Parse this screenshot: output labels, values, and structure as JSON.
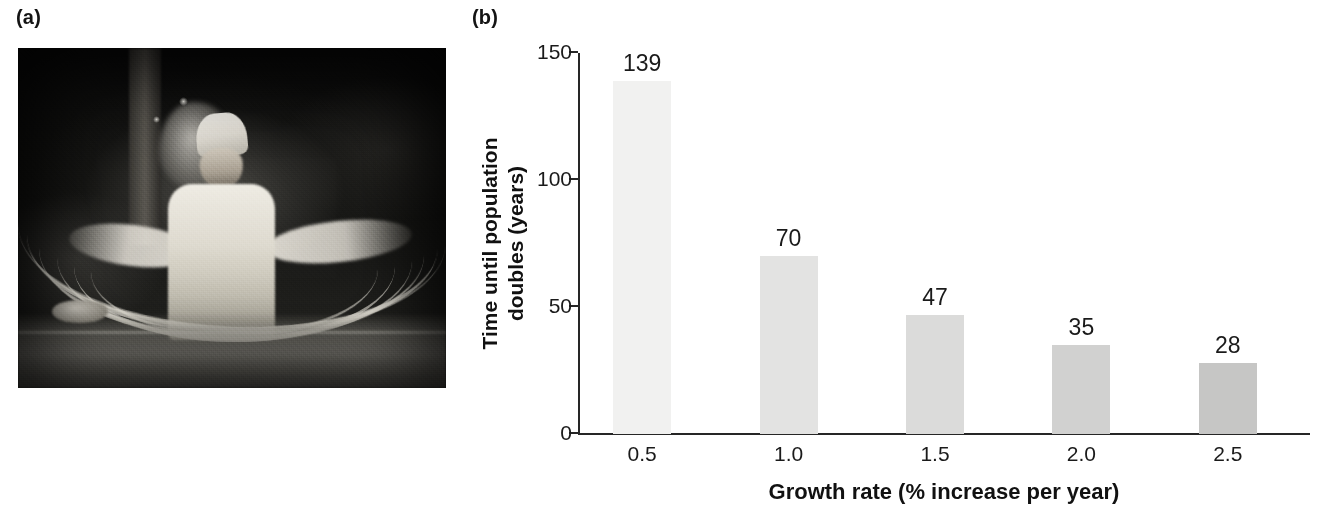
{
  "panels": {
    "photo_label": "(a)",
    "chart_label": "(b)"
  },
  "photo": {
    "alt": "noodle-maker-pulling-hand-pulled-noodles"
  },
  "chart_data": {
    "type": "bar",
    "title": "",
    "categories": [
      "0.5",
      "1.0",
      "1.5",
      "2.0",
      "2.5"
    ],
    "values": [
      139,
      70,
      47,
      35,
      28
    ],
    "bar_labels": [
      "139",
      "70",
      "47",
      "35",
      "28"
    ],
    "bar_colors": [
      "#f1f1f0",
      "#e3e3e2",
      "#dbdbda",
      "#d1d1d0",
      "#c6c6c5"
    ],
    "xlabel": "Growth rate (% increase per year)",
    "ylabel_line1": "Time until population",
    "ylabel_line2": "doubles (years)",
    "ylim": [
      0,
      150
    ],
    "yticks": [
      0,
      50,
      100,
      150
    ],
    "ytick_labels": [
      "0",
      "50",
      "100",
      "150"
    ],
    "grid": false,
    "legend": false,
    "axis_color": "#262626"
  }
}
